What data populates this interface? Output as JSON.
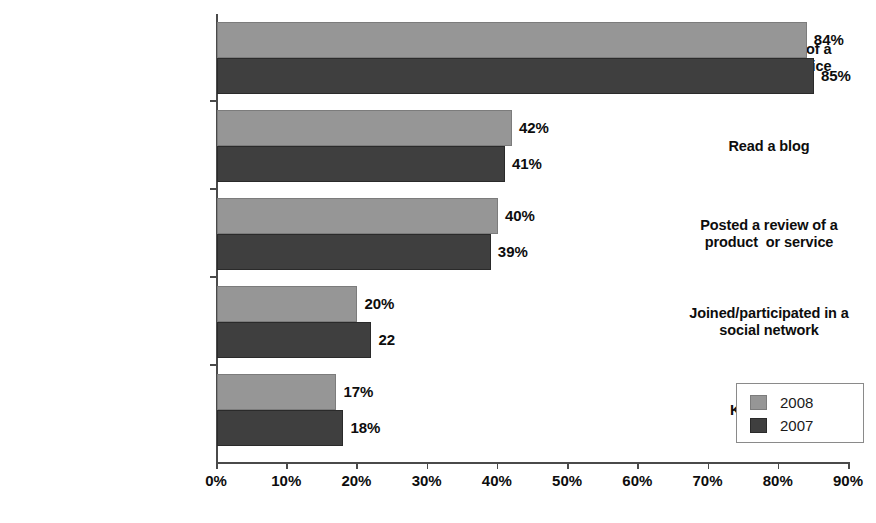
{
  "chart_data": {
    "type": "bar",
    "orientation": "horizontal",
    "title": "",
    "subtitle": "",
    "xlabel": "",
    "ylabel": "",
    "xlim": [
      0,
      90
    ],
    "xtick_labels": [
      "0%",
      "10%",
      "20%",
      "30%",
      "40%",
      "50%",
      "60%",
      "70%",
      "80%",
      "90%"
    ],
    "xtick_values": [
      0,
      10,
      20,
      30,
      40,
      50,
      60,
      70,
      80,
      90
    ],
    "grid": false,
    "legend_position": "bottom-right",
    "categories": [
      "Read a review of a\nproduct or service",
      "Read a blog",
      "Posted a review of a\nproduct  or service",
      "Joined/participated in a\nsocial network",
      "Kept a blog"
    ],
    "series": [
      {
        "name": "2008",
        "color": "#969696",
        "values": [
          84,
          42,
          40,
          20,
          17
        ],
        "data_labels": [
          "84%",
          "42%",
          "40%",
          "20%",
          "17%"
        ]
      },
      {
        "name": "2007",
        "color": "#3f3f3f",
        "values": [
          85,
          41,
          39,
          22,
          18
        ],
        "data_labels": [
          "85%",
          "41%",
          "39%",
          "22",
          "18%"
        ]
      }
    ]
  },
  "legend": {
    "entries": [
      {
        "label": "2008",
        "color": "#969696"
      },
      {
        "label": "2007",
        "color": "#3f3f3f"
      }
    ]
  },
  "colors": {
    "series_2008": "#969696",
    "series_2007": "#3f3f3f",
    "axis": "#4a4a4a",
    "text": "#0d0d0d",
    "background": "#ffffff",
    "legend_border": "#8a8a8a"
  }
}
